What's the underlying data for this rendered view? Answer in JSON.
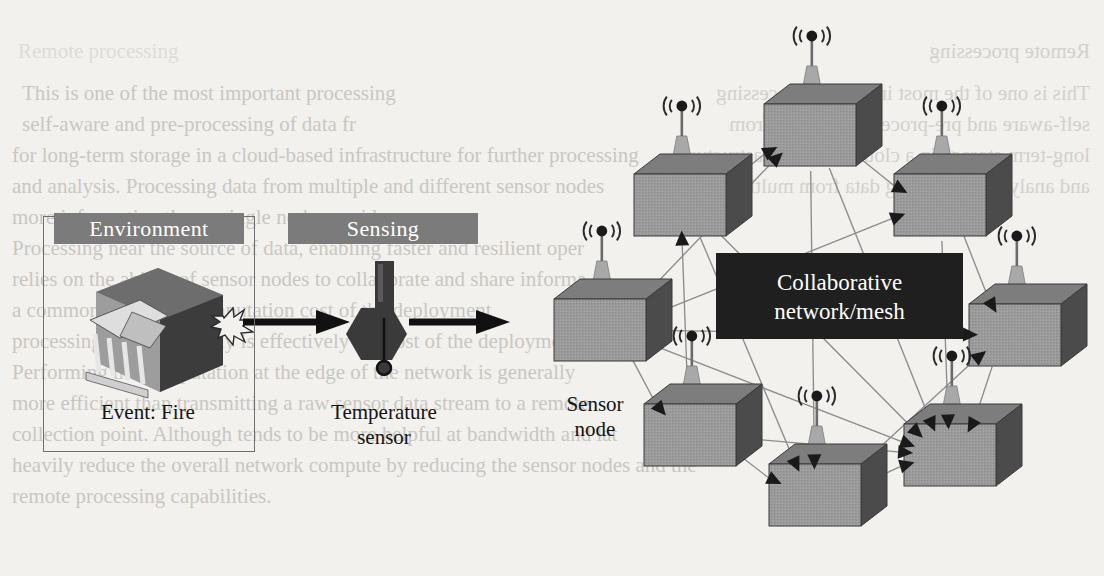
{
  "figure": {
    "type": "diagram",
    "background_color": "#f2f1ee"
  },
  "environment_panel": {
    "header_label": "Environment",
    "header_bg": "#7b7b7b",
    "header_fg": "#ffffff",
    "caption": "Event: Fire",
    "icon_name": "building-cube-fire-icon"
  },
  "sensing_panel": {
    "header_label": "Sensing",
    "header_bg": "#7b7b7b",
    "header_fg": "#ffffff",
    "caption_line1": "Temperature",
    "caption_line2": "sensor",
    "icon_name": "thermometer-icon"
  },
  "mesh": {
    "line1": "Collaborative",
    "line2": "network/mesh",
    "bg": "#1e1e1e",
    "fg": "#ffffff"
  },
  "legend": {
    "line1": "Sensor",
    "line2": "node"
  },
  "flow_arrows": [
    {
      "name": "arrow-environment-to-sensing",
      "from": "environment",
      "to": "sensing"
    },
    {
      "name": "arrow-sensing-to-network",
      "from": "sensing",
      "to": "network"
    }
  ],
  "colors": {
    "cube_front": "#9a9a9a",
    "cube_top": "#7d7d7d",
    "cube_side": "#4b4b4b",
    "cube_edge": "#3a3a3a",
    "antenna_cone": "#a8a8a8",
    "antenna_mast": "#6a6a6a",
    "link_line": "#8c8c8c",
    "arrowhead": "#1a1a1a",
    "flow_arrow": "#111111",
    "panel_border": "#6f6f6f"
  },
  "nodes": [
    {
      "id": "n1",
      "name": "sensor-node-left",
      "x": 600,
      "y": 330
    },
    {
      "id": "n2",
      "name": "sensor-node-upper-left",
      "x": 680,
      "y": 205
    },
    {
      "id": "n3",
      "name": "sensor-node-top",
      "x": 810,
      "y": 135
    },
    {
      "id": "n4",
      "name": "sensor-node-upper-right",
      "x": 940,
      "y": 205
    },
    {
      "id": "n5",
      "name": "sensor-node-right",
      "x": 1015,
      "y": 335
    },
    {
      "id": "n6",
      "name": "sensor-node-lower-left",
      "x": 690,
      "y": 435
    },
    {
      "id": "n7",
      "name": "sensor-node-bottom",
      "x": 815,
      "y": 495
    },
    {
      "id": "n8",
      "name": "sensor-node-lower-right",
      "x": 950,
      "y": 455
    }
  ],
  "links": [
    {
      "from": "n1",
      "to": "n3",
      "arrow": "to"
    },
    {
      "from": "n1",
      "to": "n4",
      "arrow": "to"
    },
    {
      "from": "n1",
      "to": "n5",
      "arrow": "to"
    },
    {
      "from": "n1",
      "to": "n6",
      "arrow": "to"
    },
    {
      "from": "n1",
      "to": "n8",
      "arrow": "to"
    },
    {
      "from": "n2",
      "to": "n3",
      "arrow": "to"
    },
    {
      "from": "n2",
      "to": "n7",
      "arrow": "to"
    },
    {
      "from": "n2",
      "to": "n8",
      "arrow": "to"
    },
    {
      "from": "n3",
      "to": "n4",
      "arrow": "to"
    },
    {
      "from": "n3",
      "to": "n7",
      "arrow": "to"
    },
    {
      "from": "n3",
      "to": "n8",
      "arrow": "to"
    },
    {
      "from": "n4",
      "to": "n5",
      "arrow": "to"
    },
    {
      "from": "n4",
      "to": "n8",
      "arrow": "to"
    },
    {
      "from": "n5",
      "to": "n8",
      "arrow": "to"
    },
    {
      "from": "n6",
      "to": "n2",
      "arrow": "to"
    },
    {
      "from": "n6",
      "to": "n7",
      "arrow": "to"
    },
    {
      "from": "n6",
      "to": "n8",
      "arrow": "to"
    },
    {
      "from": "n7",
      "to": "n8",
      "arrow": "to"
    },
    {
      "from": "n7",
      "to": "n5",
      "arrow": "to"
    }
  ],
  "bleed_text": {
    "note": "faint mirrored show-through from reverse of scanned page",
    "left_lines": [
      "This is one of the most important processing",
      "self-aware and pre-processing of data fr",
      "for long-term storage in a cloud-based infrastructure for further processing",
      "and analysis. Processing data from multiple and different sensor nodes",
      "more information than a single node provides.",
      "Processing near the source of data, enabling faster and resilient oper",
      "relies on the ability of sensor nodes to collaborate and share informa",
      "a common goal. The computation cost of the deployment",
      "processing the data locally is effectively the cost of the deployment.",
      "Performing the computation at the edge of the network is generally",
      "more efficient than transmitting a raw sensor data stream to a remote",
      "collection point. Although tends to be more helpful at bandwidth and lat",
      "heavily reduce the overall network compute by reducing the sensor nodes and the",
      "remote processing capabilities."
    ],
    "right_lines": [
      "Remote processing",
      "This is one of the most important processing",
      "self-aware and pre-processing of data from",
      "long-term storage in a cloud-based infrastructure",
      "and analysis. Processing data from multiple"
    ]
  }
}
